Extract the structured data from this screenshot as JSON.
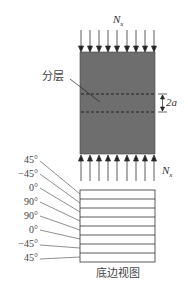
{
  "diagram": {
    "load_top": {
      "symbol": "N",
      "subscript": "x"
    },
    "load_bottom": {
      "symbol": "N",
      "subscript": "x"
    },
    "delamination_label": "分层",
    "delamination_size": "2a",
    "layup_angles": [
      "45°",
      "−45°",
      "0°",
      "90°",
      "90°",
      "0°",
      "−45°",
      "45°"
    ],
    "bottom_view_label": "底边视图",
    "colors": {
      "panel_fill": "#6e6e6e",
      "line": "#333333",
      "dash": "#1a1a1a"
    },
    "arrow_count": 9
  }
}
